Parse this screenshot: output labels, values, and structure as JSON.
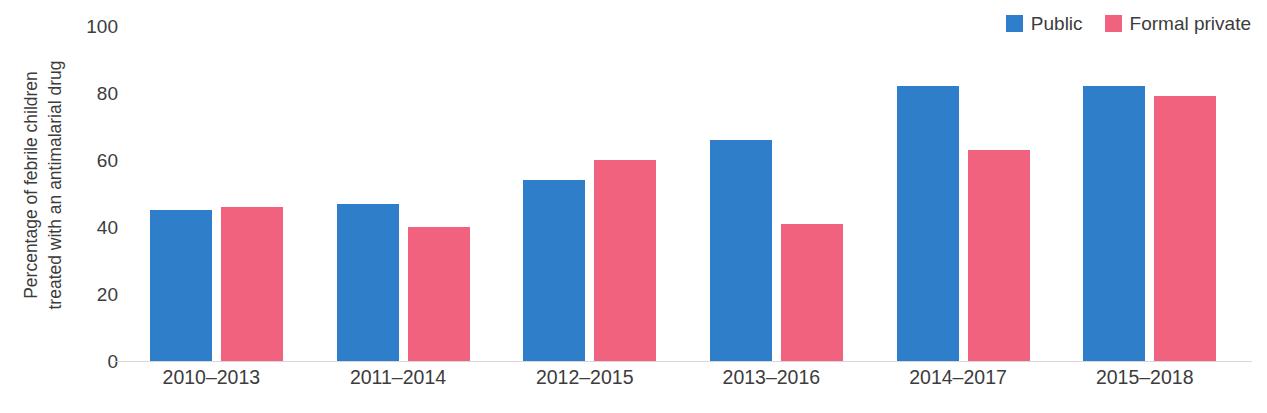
{
  "chart_data": {
    "type": "bar",
    "title": "",
    "subtitle": "",
    "xlabel": "",
    "ylabel": "Percentage of febrile children treated with an antimalarial drug",
    "ylabel_lines": [
      "Percentage of febrile children",
      "treated with an antimalarial drug"
    ],
    "categories": [
      "2010–2013",
      "2011–2014",
      "2012–2015",
      "2013–2016",
      "2014–2017",
      "2015–2018"
    ],
    "series": [
      {
        "name": "Public",
        "color": "#2E7EC9",
        "values": [
          45,
          47,
          54,
          66,
          82,
          82
        ]
      },
      {
        "name": "Formal private",
        "color": "#F0627E",
        "values": [
          46,
          40,
          60,
          41,
          63,
          79
        ]
      }
    ],
    "ylim": [
      0,
      100
    ],
    "yticks": [
      100,
      80,
      60,
      40,
      20,
      0
    ],
    "ytick_labels": [
      "100",
      "80",
      "60",
      "40",
      "20",
      "0"
    ],
    "grid": false,
    "legend_position": "top-right",
    "legend": [
      {
        "label": "Public",
        "color": "#2E7EC9",
        "swatch_name": "legend-swatch-public"
      },
      {
        "label": "Formal private",
        "color": "#F0627E",
        "swatch_name": "legend-swatch-formal-private"
      }
    ],
    "colors": {
      "public": "#2E7EC9",
      "formal_private": "#F0627E",
      "axis": "#d8d8d8",
      "text": "#3c3c3c",
      "background": "#ffffff"
    }
  }
}
